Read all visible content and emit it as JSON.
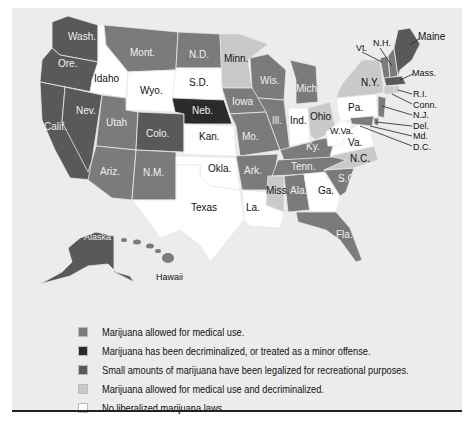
{
  "colors": {
    "medical": "#7b7b7b",
    "decriminalized": "#2b2b2b",
    "recreational": "#595959",
    "medical_and_decriminalized": "#c9c9c9",
    "none": "#ffffff",
    "panel_bg": "#ececec"
  },
  "legend": {
    "items": [
      {
        "key": "medical",
        "label": "Marijuana allowed for medical use."
      },
      {
        "key": "decriminalized",
        "label": "Marijuana has been decriminalized, or treated as a minor offense."
      },
      {
        "key": "recreational",
        "label": "Small amounts of marijuana have been legalized for recreational purposes."
      },
      {
        "key": "medical_and_decriminalized",
        "label": "Marijuana allowed for medical use and decriminalized."
      },
      {
        "key": "none",
        "label": "No liberalized marijuana laws."
      }
    ]
  },
  "states": {
    "wash": "Wash.",
    "ore": "Ore.",
    "calif": "Calif.",
    "nev": "Nev.",
    "idaho": "Idaho",
    "mont": "Mont.",
    "wyo": "Wyo.",
    "utah": "Utah",
    "colo": "Colo.",
    "ariz": "Ariz.",
    "nm": "N.M.",
    "nd": "N.D.",
    "sd": "S.D.",
    "neb": "Neb.",
    "kan": "Kan.",
    "okla": "Okla.",
    "texas": "Texas",
    "minn": "Minn.",
    "iowa": "Iowa",
    "mo": "Mo.",
    "ark": "Ark.",
    "la": "La.",
    "wis": "Wis.",
    "ill": "Ill.",
    "mich": "Mich.",
    "ind": "Ind.",
    "ohio": "Ohio",
    "ky": "Ky.",
    "tenn": "Tenn.",
    "miss": "Miss.",
    "ala": "Ala.",
    "ga": "Ga.",
    "fla": "Fla.",
    "sc": "S.C.",
    "nc": "N.C.",
    "va": "Va.",
    "wva": "W.Va.",
    "pa": "Pa.",
    "ny": "N.Y.",
    "vt": "Vt.",
    "nh": "N.H.",
    "maine": "Maine",
    "mass": "Mass.",
    "ri": "R.I.",
    "conn": "Conn.",
    "nj": "N.J.",
    "del": "Del.",
    "md": "Md.",
    "dc": "D.C.",
    "alaska": "Alaska",
    "hawaii": "Hawaii"
  },
  "state_categories": {
    "recreational": [
      "Wash.",
      "Ore.",
      "Calif.",
      "Nev.",
      "Colo.",
      "Alaska",
      "Mass.",
      "Maine"
    ],
    "medical": [
      "Mont.",
      "N.D.",
      "Utah",
      "Ariz.",
      "N.M.",
      "Iowa",
      "Mo.",
      "Ark.",
      "Wis.",
      "Ill.",
      "Mich.",
      "Ky.",
      "Tenn.",
      "Ala.",
      "Fla.",
      "S.C.",
      "Hawaii",
      "N.H.",
      "Vt.",
      "N.J.",
      "Md.",
      "Del."
    ],
    "decriminalized": [
      "Neb."
    ],
    "medical_and_decriminalized": [
      "Minn.",
      "Ohio",
      "Miss.",
      "N.C.",
      "N.Y.",
      "Conn.",
      "R.I."
    ],
    "none": [
      "Idaho",
      "Wyo.",
      "S.D.",
      "Kan.",
      "Okla.",
      "Texas",
      "La.",
      "Ind.",
      "Ga.",
      "Va.",
      "W.Va.",
      "Pa.",
      "D.C."
    ]
  }
}
